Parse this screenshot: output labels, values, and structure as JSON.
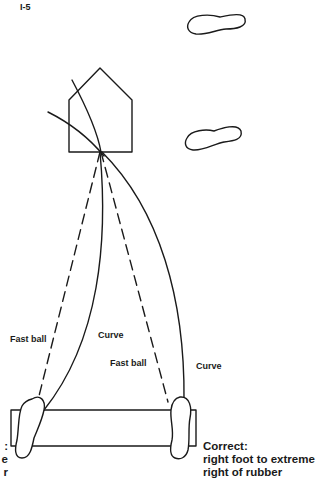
{
  "page_id": "I-5",
  "labels": {
    "fast_ball_left": "Fast ball",
    "curve_left": "Curve",
    "fast_ball_right": "Fast ball",
    "curve_right": "Curve"
  },
  "caption_right": {
    "line1": "Correct:",
    "line2": "right foot to extreme",
    "line3": "right of rubber"
  },
  "caption_left_fragment": {
    "line1": ":",
    "line2": "e",
    "line3": "r"
  },
  "colors": {
    "ink": "#1a1a1a",
    "background": "#ffffff"
  }
}
